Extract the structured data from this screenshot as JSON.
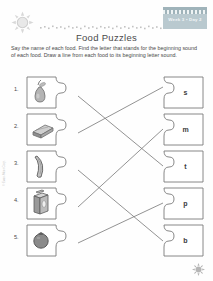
{
  "header": {
    "badge_text": "Week 3 • Day 2",
    "sun_icon": "sun-icon",
    "dotted_rule": "dotted-rule-decoration"
  },
  "title": "Food Puzzles",
  "instructions": "Say the name of each food. Find the letter that stands for the beginning sound of each food. Draw a line from each food to its beginning letter sound.",
  "food_items": [
    {
      "number": "1.",
      "icon": "pear-icon",
      "name": "pear"
    },
    {
      "number": "2.",
      "icon": "sandwich-icon",
      "name": "sandwich"
    },
    {
      "number": "3.",
      "icon": "banana-icon",
      "name": "banana"
    },
    {
      "number": "4.",
      "icon": "milk-carton-icon",
      "name": "milk"
    },
    {
      "number": "5.",
      "icon": "tomato-icon",
      "name": "tomato"
    }
  ],
  "letter_items": [
    {
      "letter": "s"
    },
    {
      "letter": "m"
    },
    {
      "letter": "t"
    },
    {
      "letter": "p"
    },
    {
      "letter": "b"
    }
  ],
  "footer": {
    "side_credit": "© Evan-Moor Corp.",
    "corner_mark": "starburst-icon"
  },
  "colors": {
    "badge_bg": "#b9c9cf",
    "ink": "#3b3b3b",
    "line": "#6b6b6b"
  }
}
